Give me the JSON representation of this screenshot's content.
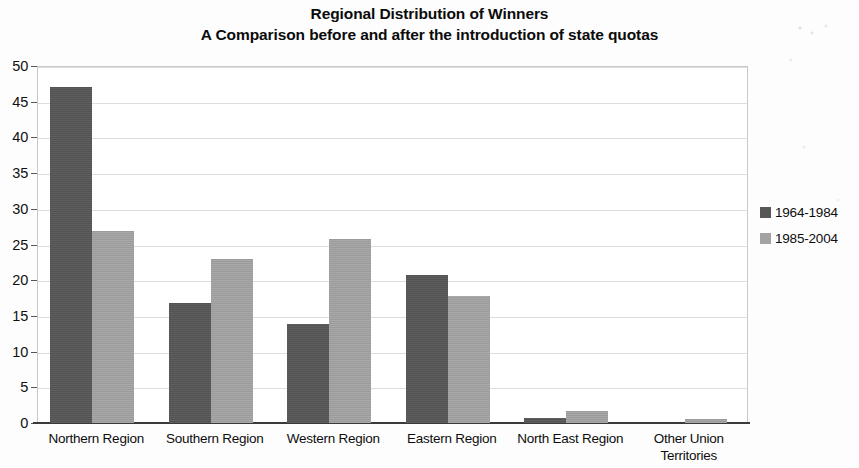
{
  "chart_data": {
    "type": "bar",
    "title": "Regional Distribution of Winners\nA Comparison before and after the introduction of state quotas",
    "title_line1": "Regional Distribution of Winners",
    "title_line2": "A Comparison before and after the introduction of state quotas",
    "xlabel": "",
    "ylabel": "",
    "ylim": [
      0,
      50
    ],
    "yticks": [
      0,
      5,
      10,
      15,
      20,
      25,
      30,
      35,
      40,
      45,
      50
    ],
    "ytick_labels": [
      "0",
      "5",
      "10",
      "15",
      "20",
      "25",
      "30",
      "35",
      "40",
      "45",
      "50"
    ],
    "grid": true,
    "legend_position": "right",
    "categories": [
      "Northern Region",
      "Southern Region",
      "Western Region",
      "Eastern Region",
      "North East Region",
      "Other Union\nTerritories"
    ],
    "series": [
      {
        "name": "1964-1984",
        "color": "#575757",
        "values": [
          47.0,
          16.8,
          13.9,
          20.8,
          0.7,
          0.0
        ]
      },
      {
        "name": "1985-2004",
        "color": "#a3a3a3",
        "values": [
          26.9,
          23.0,
          25.8,
          17.8,
          1.7,
          0.6
        ]
      }
    ]
  },
  "legend": {
    "entries": [
      {
        "label": "1964-1984",
        "swatch": "s0"
      },
      {
        "label": "1985-2004",
        "swatch": "s1"
      }
    ]
  }
}
